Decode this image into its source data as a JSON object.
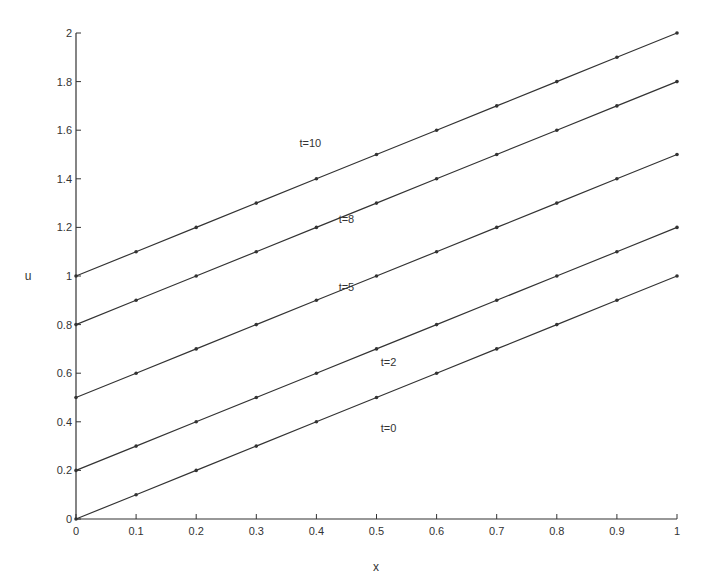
{
  "chart_data": {
    "type": "line",
    "title": "",
    "xlabel": "x",
    "ylabel": "u",
    "xlim": [
      0,
      1
    ],
    "ylim": [
      0,
      2
    ],
    "grid": false,
    "legend": "inline labels",
    "x": [
      0,
      0.1,
      0.2,
      0.3,
      0.4,
      0.5,
      0.6,
      0.7,
      0.8,
      0.9,
      1.0
    ],
    "xticks": [
      "0",
      "0.1",
      "0.2",
      "0.3",
      "0.4",
      "0.5",
      "0.6",
      "0.7",
      "0.8",
      "0.9",
      "1"
    ],
    "yticks": [
      "0",
      "0.2",
      "0.4",
      "0.6",
      "0.8",
      "1",
      "1.2",
      "1.4",
      "1.6",
      "1.8",
      "2"
    ],
    "series": [
      {
        "name": "t=0",
        "values": [
          0.0,
          0.1,
          0.2,
          0.3,
          0.4,
          0.5,
          0.6,
          0.7,
          0.8,
          0.9,
          1.0
        ],
        "label_pos": [
          0.52,
          0.36
        ]
      },
      {
        "name": "t=2",
        "values": [
          0.2,
          0.3,
          0.4,
          0.5,
          0.6,
          0.7,
          0.8,
          0.9,
          1.0,
          1.1,
          1.2
        ],
        "label_pos": [
          0.52,
          0.63
        ]
      },
      {
        "name": "t=5",
        "values": [
          0.5,
          0.6,
          0.7,
          0.8,
          0.9,
          1.0,
          1.1,
          1.2,
          1.3,
          1.4,
          1.5
        ],
        "label_pos": [
          0.45,
          0.94
        ]
      },
      {
        "name": "t=8",
        "values": [
          0.8,
          0.9,
          1.0,
          1.1,
          1.2,
          1.3,
          1.4,
          1.5,
          1.6,
          1.7,
          1.8
        ],
        "label_pos": [
          0.45,
          1.22
        ]
      },
      {
        "name": "t=10",
        "values": [
          1.0,
          1.1,
          1.2,
          1.3,
          1.4,
          1.5,
          1.6,
          1.7,
          1.8,
          1.9,
          2.0
        ],
        "label_pos": [
          0.39,
          1.53
        ]
      }
    ]
  },
  "colors": {
    "line": "#333333",
    "axis": "#333333",
    "background": "#ffffff"
  }
}
